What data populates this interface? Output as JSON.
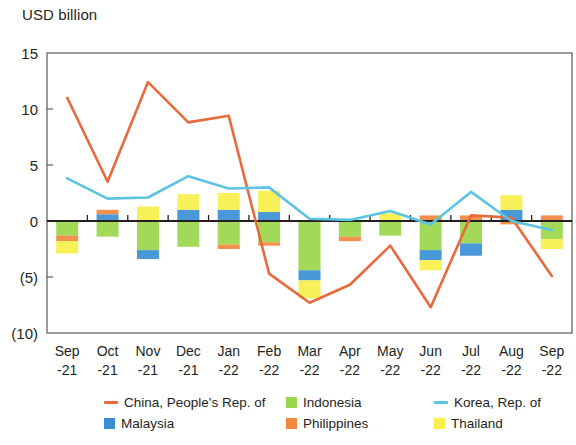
{
  "chart_data": {
    "type": "bar",
    "title": "",
    "ylabel": "USD billion",
    "xlabel": "",
    "ylim": [
      -10,
      15
    ],
    "ytick_labels": [
      "15",
      "10",
      "5",
      "0",
      "(5)",
      "(10)"
    ],
    "ytick_values": [
      15,
      10,
      5,
      0,
      -5,
      -10
    ],
    "grid": false,
    "legend_position": "bottom",
    "categories": [
      "Sep\n-21",
      "Oct\n-21",
      "Nov\n-21",
      "Dec\n-21",
      "Jan\n-22",
      "Feb\n-22",
      "Mar\n-22",
      "Apr\n-22",
      "May\n-22",
      "Jun\n-22",
      "Jul\n-22",
      "Aug\n-22",
      "Sep\n-22"
    ],
    "category_labels_top": [
      "Sep",
      "Oct",
      "Nov",
      "Dec",
      "Jan",
      "Feb",
      "Mar",
      "Apr",
      "May",
      "Jun",
      "Jul",
      "Aug",
      "Sep"
    ],
    "category_labels_bottom": [
      "-21",
      "-21",
      "-21",
      "-21",
      "-22",
      "-22",
      "-22",
      "-22",
      "-22",
      "-22",
      "-22",
      "-22",
      "-22"
    ],
    "stacked_series": [
      {
        "name": "Indonesia",
        "color": "#9ad64b",
        "values": [
          -1.3,
          -1.4,
          -2.6,
          -2.3,
          -2.1,
          -1.9,
          -4.4,
          -1.4,
          -1.3,
          -2.6,
          -2.0,
          0.0,
          -1.6
        ]
      },
      {
        "name": "Malaysia",
        "color": "#3a8fd4",
        "values": [
          0.0,
          0.6,
          -0.8,
          1.0,
          1.0,
          0.8,
          -0.9,
          0.0,
          0.0,
          -0.9,
          -1.1,
          1.0,
          0.0
        ]
      },
      {
        "name": "Philippines",
        "color": "#f2873f",
        "values": [
          -0.5,
          0.4,
          0.0,
          0.0,
          -0.4,
          -0.3,
          0.0,
          -0.4,
          0.0,
          0.5,
          0.5,
          -0.3,
          0.5
        ]
      },
      {
        "name": "Thailand",
        "color": "#f7ef4a",
        "values": [
          -1.1,
          0.0,
          1.3,
          1.4,
          1.5,
          1.9,
          -1.6,
          0.0,
          0.7,
          -0.9,
          0.0,
          1.3,
          -0.9
        ]
      }
    ],
    "line_series": [
      {
        "name": "China, People's Rep. of",
        "color": "#e8693c",
        "values": [
          11.0,
          3.5,
          12.4,
          8.8,
          9.4,
          -4.7,
          -7.3,
          -5.7,
          -2.2,
          -7.7,
          0.5,
          0.3,
          -4.9
        ]
      },
      {
        "name": "Korea, Rep. of",
        "color": "#5bc4e0",
        "values": [
          3.8,
          2.0,
          2.1,
          4.0,
          2.9,
          3.0,
          0.2,
          0.1,
          0.9,
          -0.3,
          2.6,
          0.0,
          -0.8
        ]
      }
    ]
  },
  "legend": {
    "entries": [
      {
        "label": "China, People's Rep. of",
        "color": "#e8693c",
        "marker": "line"
      },
      {
        "label": "Indonesia",
        "color": "#9ad64b",
        "marker": "square"
      },
      {
        "label": "Korea, Rep. of",
        "color": "#5bc4e0",
        "marker": "line"
      },
      {
        "label": "Malaysia",
        "color": "#3a8fd4",
        "marker": "square"
      },
      {
        "label": "Philippines",
        "color": "#f2873f",
        "marker": "square"
      },
      {
        "label": "Thailand",
        "color": "#f7ef4a",
        "marker": "square"
      }
    ]
  }
}
